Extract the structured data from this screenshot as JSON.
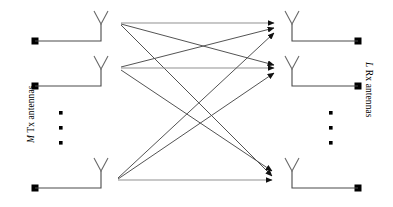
{
  "figure": {
    "background_color": "#ffffff",
    "line_color": "#3a3a3a",
    "arrow_color": "#1a1a1a",
    "terminal_color": "#000000",
    "labels": {
      "left_italic": "M",
      "left_text": " Tx antennas",
      "left_full": "M Tx antennas",
      "right_italic": "L",
      "right_text": " Rx antennas",
      "right_full": "L Rx antennas"
    },
    "ellipsis_left": {
      "name": "vertical-ellipsis-left",
      "dot_count": 3,
      "x": 61,
      "ys": [
        113,
        127,
        143
      ]
    },
    "ellipsis_right": {
      "name": "vertical-ellipsis-right",
      "dot_count": 3,
      "x": 331,
      "ys": [
        113,
        127,
        143
      ]
    },
    "tx_antennas": [
      {
        "name": "tx-antenna-1",
        "square_x": 35,
        "baseline_y": 41,
        "mast_x": 101,
        "tip_y": 11
      },
      {
        "name": "tx-antenna-2",
        "square_x": 35,
        "baseline_y": 86,
        "mast_x": 101,
        "tip_y": 56
      },
      {
        "name": "tx-antenna-m",
        "square_x": 35,
        "baseline_y": 188,
        "mast_x": 101,
        "tip_y": 158
      }
    ],
    "rx_antennas": [
      {
        "name": "rx-antenna-1",
        "square_x": 358,
        "baseline_y": 41,
        "mast_x": 292,
        "tip_y": 11
      },
      {
        "name": "rx-antenna-2",
        "square_x": 358,
        "baseline_y": 86,
        "mast_x": 292,
        "tip_y": 56
      },
      {
        "name": "rx-antenna-l",
        "square_x": 358,
        "baseline_y": 188,
        "mast_x": 292,
        "tip_y": 158
      }
    ],
    "tx_hubs": [
      {
        "name": "tx-hub-1",
        "x": 121,
        "y": 23
      },
      {
        "name": "tx-hub-2",
        "x": 121,
        "y": 68
      },
      {
        "name": "tx-hub-m",
        "x": 118,
        "y": 179
      }
    ],
    "rx_hubs": [
      {
        "name": "rx-hub-1",
        "x": 275,
        "y": 23
      },
      {
        "name": "rx-hub-2",
        "x": 275,
        "y": 68
      },
      {
        "name": "rx-hub-l",
        "x": 275,
        "y": 179
      }
    ],
    "paths": [
      {
        "name": "path-tx1-rx1",
        "from": 0,
        "to": 0,
        "x1": 121,
        "y1": 23,
        "x2": 275,
        "y2": 23,
        "offset_in": 0,
        "offset_out": 0
      },
      {
        "name": "path-tx1-rx2",
        "from": 0,
        "to": 1,
        "x1": 121,
        "y1": 23,
        "x2": 275,
        "y2": 68,
        "offset_in": 3,
        "offset_out": 0
      },
      {
        "name": "path-tx1-rxl",
        "from": 0,
        "to": 2,
        "x1": 121,
        "y1": 23,
        "x2": 275,
        "y2": 179,
        "offset_in": 6,
        "offset_out": 0
      },
      {
        "name": "path-tx2-rx1",
        "from": 1,
        "to": 0,
        "x1": 121,
        "y1": 68,
        "x2": 275,
        "y2": 23,
        "offset_in": 0,
        "offset_out": 5
      },
      {
        "name": "path-tx2-rx2",
        "from": 1,
        "to": 1,
        "x1": 121,
        "y1": 68,
        "x2": 275,
        "y2": 68,
        "offset_in": 3,
        "offset_out": 5
      },
      {
        "name": "path-tx2-rxl",
        "from": 1,
        "to": 2,
        "x1": 121,
        "y1": 68,
        "x2": 275,
        "y2": 179,
        "offset_in": 6,
        "offset_out": 5
      },
      {
        "name": "path-txm-rx1",
        "from": 2,
        "to": 0,
        "x1": 118,
        "y1": 179,
        "x2": 275,
        "y2": 23,
        "offset_in": 0,
        "offset_out": 10
      },
      {
        "name": "path-txm-rx2",
        "from": 2,
        "to": 1,
        "x1": 118,
        "y1": 179,
        "x2": 275,
        "y2": 68,
        "offset_in": 3,
        "offset_out": 10
      },
      {
        "name": "path-txm-rxl",
        "from": 2,
        "to": 2,
        "x1": 118,
        "y1": 179,
        "x2": 275,
        "y2": 179,
        "offset_in": 6,
        "offset_out": 10
      }
    ]
  }
}
